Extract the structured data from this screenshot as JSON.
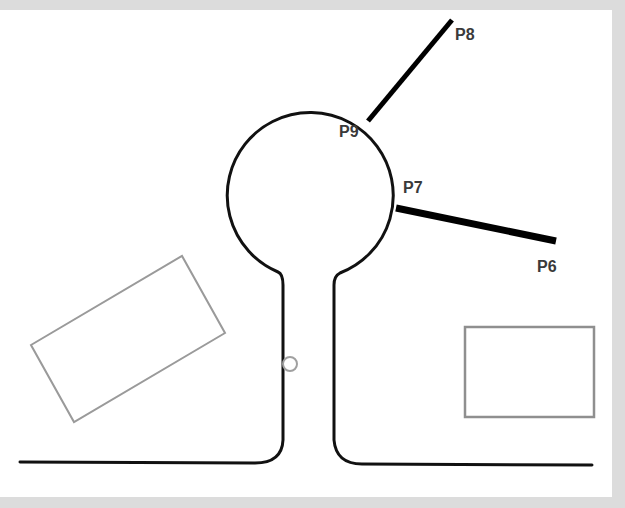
{
  "diagram": {
    "colors": {
      "background": "#dcdcdc",
      "canvas": "#ffffff",
      "outline": "#111111",
      "segment": "#000000",
      "obstacle": "#9a9a9a",
      "label": "#3a3a3a"
    },
    "points": [
      {
        "id": "P8",
        "label": "P8",
        "x": 455,
        "y": 40
      },
      {
        "id": "P9",
        "label": "P9",
        "x": 339,
        "y": 137
      },
      {
        "id": "P7",
        "label": "P7",
        "x": 403,
        "y": 193
      },
      {
        "id": "P6",
        "label": "P6",
        "x": 537,
        "y": 272
      }
    ],
    "segments": [
      {
        "from": "P9",
        "to": "P8"
      },
      {
        "from": "P7",
        "to": "P6"
      }
    ],
    "shapes": {
      "keyhole_outline": "Circle head with narrow stem and flared base",
      "rotated_rectangle": "Obstacle rectangle tilted on left",
      "upright_rectangle": "Obstacle rectangle on right",
      "small_circle": "Small marker on stem"
    }
  }
}
